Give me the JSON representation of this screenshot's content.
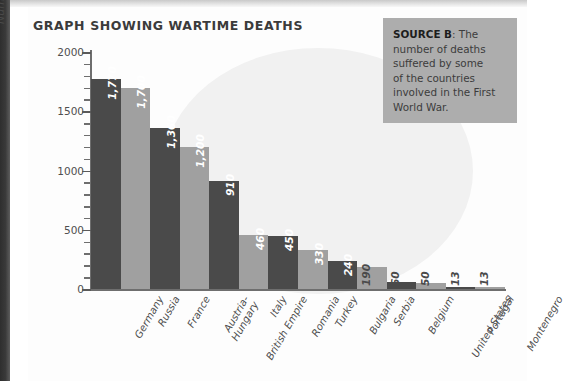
{
  "page": {
    "title": "GRAPH SHOWING WARTIME DEATHS"
  },
  "source_box": {
    "label": "SOURCE B",
    "lines": [
      ": The",
      "number of deaths",
      "suffered by some",
      "of the countries",
      "involved in the First",
      "World War."
    ]
  },
  "colors": {
    "bar_dark": "#4a4a4a",
    "bar_light": "#a0a0a0",
    "axis": "#6e6e6e",
    "source_bg": "#adadad",
    "watermark": "#f1f1f1"
  },
  "chart_data": {
    "type": "bar",
    "title": "GRAPH SHOWING WARTIME DEATHS",
    "xlabel": "",
    "ylabel": "Numbers of deaths (in thousands)",
    "ylim": [
      0,
      2000
    ],
    "ytick_labels": [
      "2000",
      "1500",
      "1000",
      "500",
      "0"
    ],
    "ytick_values": [
      2000,
      1500,
      1000,
      500,
      0
    ],
    "minor_tick_step": 100,
    "grid": false,
    "legend": "none",
    "categories": [
      "Germany",
      "Russia",
      "France",
      "Austria-\nHungary",
      "British Empire",
      "Italy",
      "Romania",
      "Turkey",
      "Bulgaria",
      "Serbia",
      "Belgium",
      "United States",
      "Portugal",
      "Montenegro"
    ],
    "values": [
      1770,
      1700,
      1360,
      1200,
      910,
      460,
      450,
      330,
      240,
      190,
      60,
      50,
      13,
      13
    ],
    "value_labels": [
      "1,770",
      "1,700",
      "1,360",
      "1,200",
      "910",
      "460",
      "450",
      "330",
      "240",
      "190",
      "60",
      "50",
      "13",
      "13"
    ]
  }
}
